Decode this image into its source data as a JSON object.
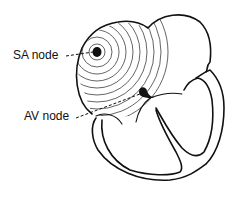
{
  "diagram": {
    "labels": {
      "sa_node": "SA node",
      "av_node": "AV node"
    },
    "colors": {
      "line": "#111111",
      "background": "#ffffff"
    }
  }
}
